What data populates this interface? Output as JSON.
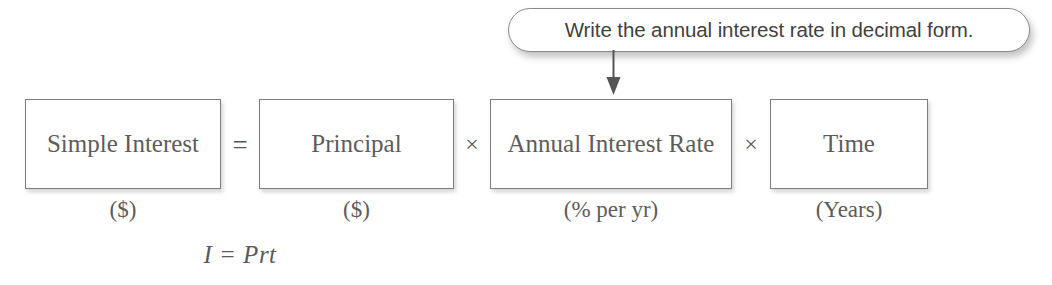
{
  "diagram": {
    "callout": {
      "text": "Write the annual interest rate in decimal form.",
      "points_to": "Annual Interest Rate"
    },
    "terms": [
      {
        "label": "Simple Interest",
        "unit": "($)"
      },
      {
        "label": "Principal",
        "unit": "($)"
      },
      {
        "label": "Annual Interest Rate",
        "unit": "(% per yr)"
      },
      {
        "label": "Time",
        "unit": "(Years)"
      }
    ],
    "operators": {
      "equals": "=",
      "times_1": "×",
      "times_2": "×"
    },
    "formula": "I = Prt",
    "colors": {
      "background": "#ffffff",
      "box_border": "#7d7d7d",
      "box_text": "#5c5c5c",
      "callout_border": "#8a8a8a",
      "callout_text": "#3f3f3f",
      "arrow": "#555555"
    }
  }
}
